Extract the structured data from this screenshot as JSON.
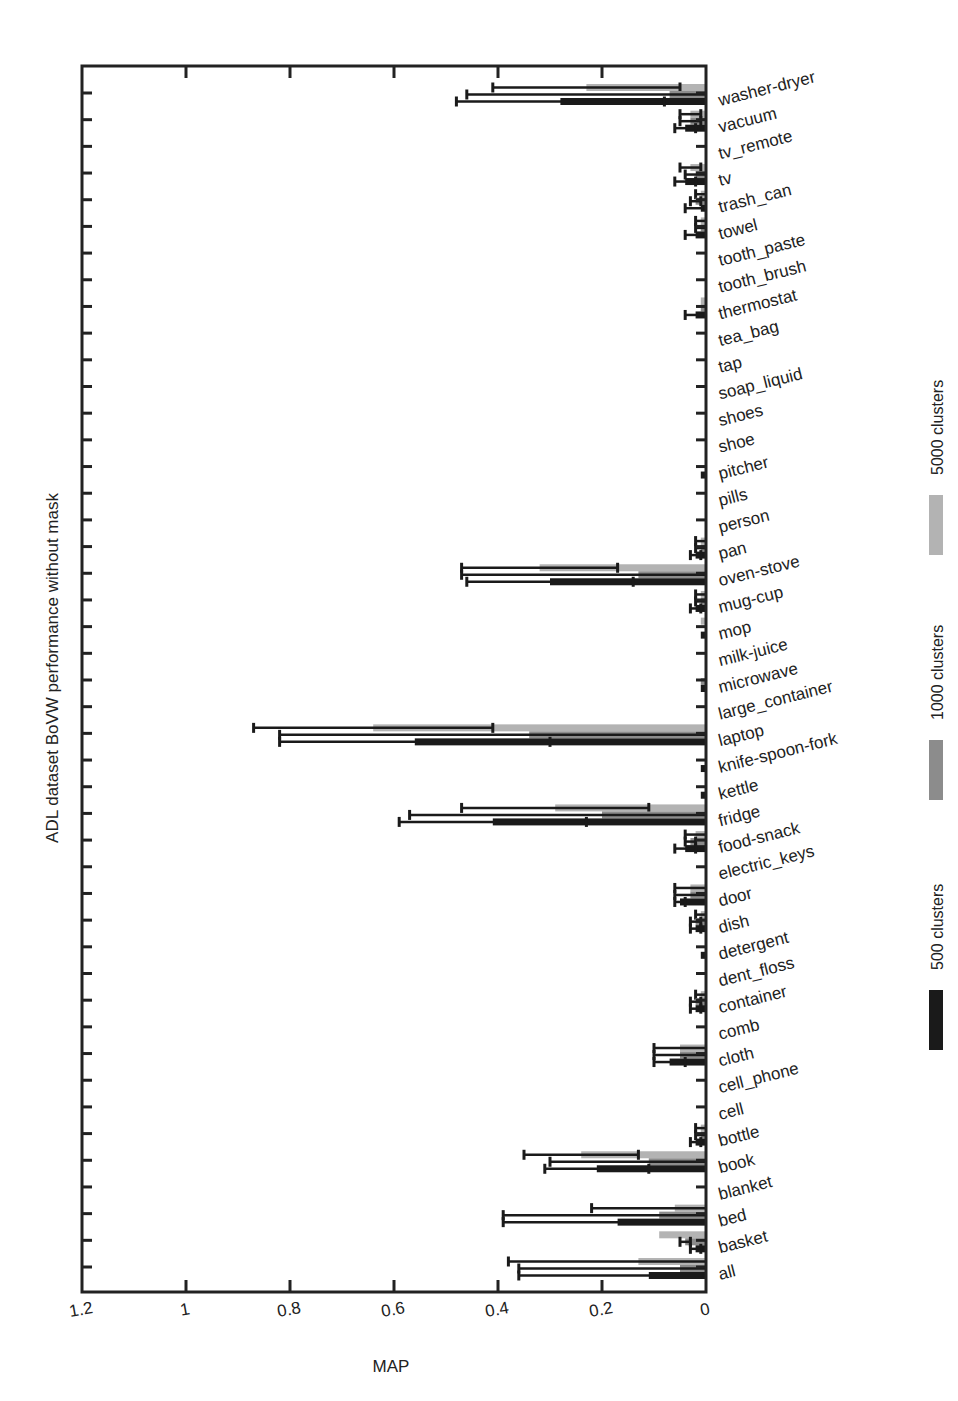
{
  "chart_data": {
    "type": "bar",
    "orientation": "horizontal",
    "title": "",
    "ylabel": "ADL dataset BoVW performance without mask",
    "xlabel": "MAP",
    "xlim": [
      1.2,
      0
    ],
    "x_reversed": true,
    "x_ticks": [
      "1.2",
      "1",
      "0.8",
      "0.6",
      "0.4",
      "0.2",
      "0"
    ],
    "x_tick_values": [
      1.2,
      1.0,
      0.8,
      0.6,
      0.4,
      0.2,
      0
    ],
    "grid": false,
    "legend_position": "right, rotated",
    "categories": [
      "washer-dryer",
      "vacuum",
      "tv_remote",
      "tv",
      "trash_can",
      "towel",
      "tooth_paste",
      "tooth_brush",
      "thermostat",
      "tea_bag",
      "tap",
      "soap_liquid",
      "shoes",
      "shoe",
      "pitcher",
      "pills",
      "person",
      "pan",
      "oven-stove",
      "mug-cup",
      "mop",
      "milk-juice",
      "microwave",
      "large_container",
      "laptop",
      "knife-spoon-fork",
      "kettle",
      "fridge",
      "food-snack",
      "electric_keys",
      "door",
      "dish",
      "detergent",
      "dent_floss",
      "container",
      "comb",
      "cloth",
      "cell_phone",
      "cell",
      "bottle",
      "book",
      "blanket",
      "bed",
      "basket",
      "all"
    ],
    "series": [
      {
        "name": "5000 clusters",
        "color": "#b3b3b3",
        "values": [
          0.23,
          0.03,
          0,
          0.03,
          0.01,
          0.01,
          0,
          0,
          0.01,
          0,
          0,
          0,
          0,
          0,
          0,
          0,
          0,
          0.01,
          0.32,
          0.01,
          0.01,
          0,
          0,
          0,
          0.64,
          0,
          0,
          0.29,
          0.02,
          0,
          0.03,
          0.01,
          0,
          0,
          0.01,
          0,
          0.05,
          0,
          0,
          0.01,
          0.24,
          0,
          0.06,
          0.09,
          0.13
        ],
        "errors": [
          0.18,
          0.02,
          0,
          0.02,
          0.01,
          0.01,
          0,
          0,
          0,
          0,
          0,
          0,
          0,
          0,
          0,
          0,
          0,
          0.01,
          0.15,
          0.01,
          0,
          0,
          0,
          0,
          0.23,
          0,
          0,
          0.18,
          0.02,
          0,
          0.03,
          0.01,
          0,
          0,
          0.01,
          0,
          0.05,
          0,
          0,
          0.01,
          0.11,
          0,
          0.16,
          0.0,
          0.25
        ]
      },
      {
        "name": "1000 clusters",
        "color": "#8c8c8c",
        "values": [
          0.07,
          0.03,
          0,
          0.02,
          0.02,
          0.01,
          0,
          0,
          0.01,
          0,
          0,
          0,
          0,
          0,
          0,
          0,
          0,
          0.01,
          0.13,
          0.01,
          0,
          0,
          0.01,
          0,
          0.34,
          0,
          0,
          0.2,
          0.03,
          0,
          0.03,
          0.02,
          0,
          0,
          0.02,
          0,
          0.05,
          0,
          0,
          0.01,
          0.11,
          0,
          0.09,
          0.04,
          0.05
        ],
        "errors": [
          0.39,
          0.02,
          0,
          0.02,
          0.01,
          0.01,
          0,
          0,
          0,
          0,
          0,
          0,
          0,
          0,
          0,
          0,
          0,
          0.01,
          0.34,
          0.01,
          0,
          0,
          0,
          0,
          0.48,
          0,
          0,
          0.37,
          0.01,
          0,
          0.03,
          0.01,
          0,
          0,
          0.01,
          0,
          0.05,
          0,
          0,
          0.01,
          0.19,
          0,
          0.3,
          0.01,
          0.31
        ]
      },
      {
        "name": "500 clusters",
        "color": "#1a1a1a",
        "values": [
          0.28,
          0.04,
          0,
          0.04,
          0.01,
          0.02,
          0,
          0,
          0.02,
          0,
          0,
          0,
          0,
          0,
          0.01,
          0,
          0,
          0.02,
          0.3,
          0.02,
          0.01,
          0,
          0.01,
          0,
          0.56,
          0.01,
          0.01,
          0.41,
          0.04,
          0,
          0.05,
          0.02,
          0.01,
          0,
          0.02,
          0,
          0.07,
          0,
          0,
          0.02,
          0.21,
          0,
          0.17,
          0.02,
          0.11
        ],
        "errors": [
          0.2,
          0.02,
          0,
          0.02,
          0.03,
          0.02,
          0,
          0,
          0.02,
          0,
          0,
          0,
          0,
          0,
          0,
          0,
          0,
          0.01,
          0.16,
          0.01,
          0,
          0,
          0,
          0,
          0.26,
          0,
          0,
          0.18,
          0.02,
          0,
          0.01,
          0.01,
          0,
          0,
          0.01,
          0,
          0.03,
          0,
          0,
          0.01,
          0.1,
          0,
          0.22,
          0.01,
          0.25
        ]
      }
    ]
  },
  "legend": [
    {
      "label": "500 clusters",
      "color": "#1a1a1a"
    },
    {
      "label": "1000 clusters",
      "color": "#8c8c8c"
    },
    {
      "label": "5000 clusters",
      "color": "#b3b3b3"
    }
  ],
  "axis": {
    "ylabel": "ADL dataset BoVW performance without mask",
    "xlabel": "MAP"
  }
}
